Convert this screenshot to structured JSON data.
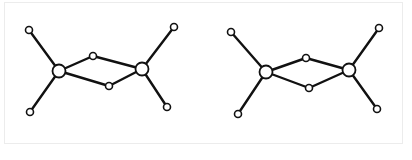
{
  "figure": {
    "caption": "",
    "style": {
      "bond_color": "#111111",
      "node_fill": "#ffffff",
      "node_stroke": "#111111",
      "frame_color": "#ececec"
    },
    "molecules": [
      {
        "id": "left",
        "nodes": [
          {
            "id": "leaf_tl",
            "x": 29,
            "y": 30,
            "r": 3.5
          },
          {
            "id": "leaf_bl",
            "x": 30,
            "y": 112,
            "r": 3.5
          },
          {
            "id": "hub_l",
            "x": 59,
            "y": 71,
            "r": 6.5
          },
          {
            "id": "mid_t",
            "x": 93,
            "y": 56,
            "r": 3.5
          },
          {
            "id": "mid_b",
            "x": 109,
            "y": 86,
            "r": 3.5
          },
          {
            "id": "hub_r",
            "x": 142,
            "y": 69,
            "r": 6.5
          },
          {
            "id": "leaf_tr",
            "x": 174,
            "y": 27,
            "r": 3.5
          },
          {
            "id": "leaf_br",
            "x": 167,
            "y": 107,
            "r": 3.5
          }
        ],
        "bonds": [
          [
            "leaf_tl",
            "hub_l"
          ],
          [
            "leaf_bl",
            "hub_l"
          ],
          [
            "hub_l",
            "mid_t"
          ],
          [
            "mid_t",
            "hub_r"
          ],
          [
            "hub_l",
            "mid_b"
          ],
          [
            "mid_b",
            "hub_r"
          ],
          [
            "hub_r",
            "leaf_tr"
          ],
          [
            "hub_r",
            "leaf_br"
          ]
        ]
      },
      {
        "id": "right",
        "nodes": [
          {
            "id": "leaf_tl",
            "x": 231,
            "y": 32,
            "r": 3.5
          },
          {
            "id": "leaf_bl",
            "x": 238,
            "y": 114,
            "r": 3.5
          },
          {
            "id": "hub_l",
            "x": 266,
            "y": 72,
            "r": 6.5
          },
          {
            "id": "mid_t",
            "x": 306,
            "y": 58,
            "r": 3.5
          },
          {
            "id": "mid_b",
            "x": 309,
            "y": 88,
            "r": 3.5
          },
          {
            "id": "hub_r",
            "x": 349,
            "y": 70,
            "r": 6.5
          },
          {
            "id": "leaf_tr",
            "x": 379,
            "y": 28,
            "r": 3.5
          },
          {
            "id": "leaf_br",
            "x": 377,
            "y": 109,
            "r": 3.5
          }
        ],
        "bonds": [
          [
            "leaf_tl",
            "hub_l"
          ],
          [
            "leaf_bl",
            "hub_l"
          ],
          [
            "hub_l",
            "mid_t"
          ],
          [
            "mid_t",
            "hub_r"
          ],
          [
            "hub_l",
            "mid_b"
          ],
          [
            "mid_b",
            "hub_r"
          ],
          [
            "hub_r",
            "leaf_tr"
          ],
          [
            "hub_r",
            "leaf_br"
          ]
        ]
      }
    ]
  }
}
